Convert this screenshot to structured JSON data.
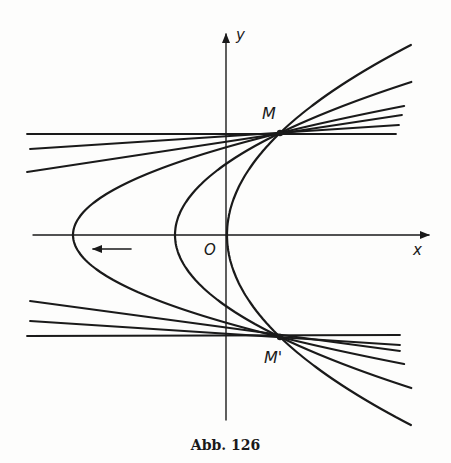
{
  "figure": {
    "caption": "Abb. 126",
    "axes": {
      "x_label": "x",
      "y_label": "y",
      "origin_label": "O"
    },
    "points": {
      "upper": {
        "label": "M",
        "px": [
          280,
          133
        ]
      },
      "lower": {
        "label": "M'",
        "px": [
          280,
          337
        ]
      }
    },
    "parabolas": [
      {
        "name": "outer",
        "vertex_px": [
          73,
          235
        ]
      },
      {
        "name": "middle",
        "vertex_px": [
          175,
          235
        ]
      },
      {
        "name": "inner",
        "vertex_px": [
          227,
          235
        ]
      }
    ],
    "arrow": {
      "direction": "left",
      "from_px": [
        130,
        249
      ],
      "to_px": [
        92,
        249
      ]
    },
    "colors": {
      "ink": "#1a1a1a",
      "paper": "#fdfdfc"
    }
  }
}
